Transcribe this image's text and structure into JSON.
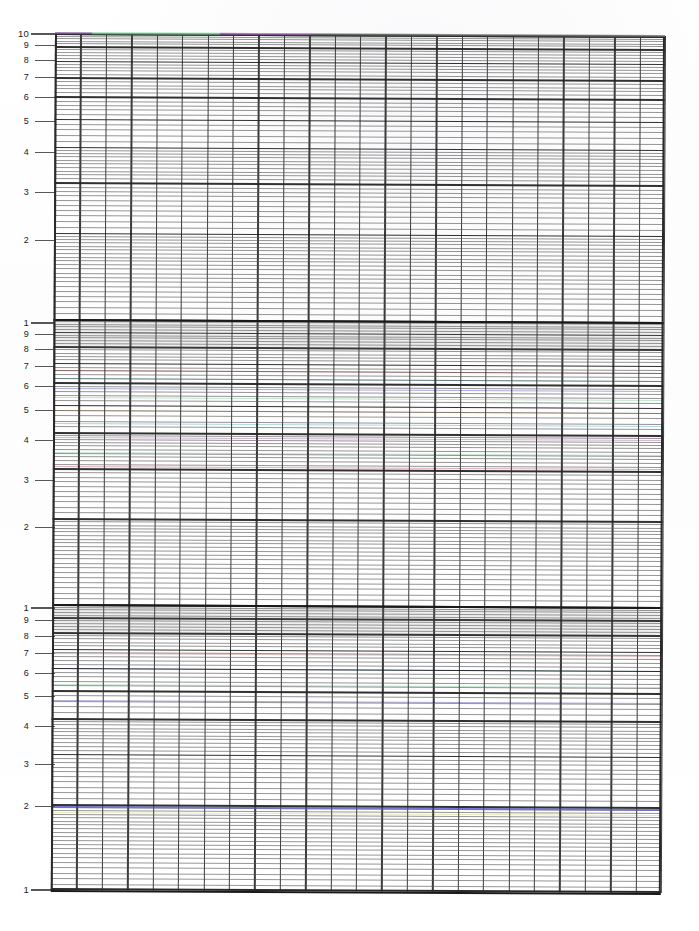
{
  "document": {
    "kind": "graph-paper-scan",
    "title": "3-cycle semi-logarithmic graph paper (scanned)",
    "background_color": "#fefefe",
    "paper_tint": "#fdfdfd"
  },
  "grid": {
    "left_px": 55,
    "top_px": 33,
    "width_px": 610,
    "height_px": 857,
    "skew_degrees": 0.28,
    "minor_line_color": "#555555",
    "major_line_color": "#262626",
    "decade_line_color": "#1a1a1a",
    "frame_color": "#2a2a2a",
    "x_columns": 24,
    "x_major_every": 1,
    "cycles": 3
  },
  "top_rule_segments": [
    {
      "name": "segment-purple-left",
      "start_pct": 0.0,
      "end_pct": 6.0,
      "color": "#8a5fa8"
    },
    {
      "name": "segment-green",
      "start_pct": 6.0,
      "end_pct": 27.0,
      "color": "#7ad79a"
    },
    {
      "name": "segment-magenta",
      "start_pct": 27.0,
      "end_pct": 42.0,
      "color": "#9b5fb0"
    },
    {
      "name": "segment-grey-right",
      "start_pct": 42.0,
      "end_pct": 100.0,
      "color": "#6e6e6e"
    }
  ],
  "chart_data": {
    "type": "line",
    "title": "",
    "subtitle": "",
    "xlabel": "",
    "ylabel": "",
    "grid": true,
    "legend_position": "none",
    "x_scale": "linear",
    "y_scale": "log",
    "xlim": [
      0,
      24
    ],
    "ylim": [
      1,
      1000
    ],
    "y_axis": {
      "scale": "log",
      "cycles": 3,
      "top_value": 10,
      "bottom_value": 1,
      "decade_labels": [
        "10",
        "1",
        "1",
        "1"
      ],
      "tick_labels_per_cycle": [
        "1",
        "2",
        "3",
        "4",
        "5",
        "6",
        "7",
        "8",
        "9"
      ]
    },
    "y_tick_labels": [
      {
        "text": "10",
        "y_px": 33,
        "cycle": 0,
        "mantissa": 10,
        "major": true
      },
      {
        "text": "9",
        "y_px": 45,
        "cycle": 0,
        "mantissa": 9,
        "major": false
      },
      {
        "text": "8",
        "y_px": 60,
        "cycle": 0,
        "mantissa": 8,
        "major": false
      },
      {
        "text": "7",
        "y_px": 77,
        "cycle": 0,
        "mantissa": 7,
        "major": false
      },
      {
        "text": "6",
        "y_px": 97,
        "cycle": 0,
        "mantissa": 6,
        "major": false
      },
      {
        "text": "5",
        "y_px": 121,
        "cycle": 0,
        "mantissa": 5,
        "major": false
      },
      {
        "text": "4",
        "y_px": 152,
        "cycle": 0,
        "mantissa": 4,
        "major": false
      },
      {
        "text": "3",
        "y_px": 192,
        "cycle": 0,
        "mantissa": 3,
        "major": false
      },
      {
        "text": "2",
        "y_px": 240,
        "cycle": 0,
        "mantissa": 2,
        "major": false
      },
      {
        "text": "1",
        "y_px": 322,
        "cycle": 1,
        "mantissa": 1,
        "major": true
      },
      {
        "text": "9",
        "y_px": 334,
        "cycle": 1,
        "mantissa": 9,
        "major": false
      },
      {
        "text": "8",
        "y_px": 349,
        "cycle": 1,
        "mantissa": 8,
        "major": false
      },
      {
        "text": "7",
        "y_px": 366,
        "cycle": 1,
        "mantissa": 7,
        "major": false
      },
      {
        "text": "6",
        "y_px": 386,
        "cycle": 1,
        "mantissa": 6,
        "major": false
      },
      {
        "text": "5",
        "y_px": 410,
        "cycle": 1,
        "mantissa": 5,
        "major": false
      },
      {
        "text": "4",
        "y_px": 440,
        "cycle": 1,
        "mantissa": 4,
        "major": false
      },
      {
        "text": "3",
        "y_px": 480,
        "cycle": 1,
        "mantissa": 3,
        "major": false
      },
      {
        "text": "2",
        "y_px": 527,
        "cycle": 1,
        "mantissa": 2,
        "major": false
      },
      {
        "text": "1",
        "y_px": 607,
        "cycle": 2,
        "mantissa": 1,
        "major": true
      },
      {
        "text": "9",
        "y_px": 620,
        "cycle": 2,
        "mantissa": 9,
        "major": false
      },
      {
        "text": "8",
        "y_px": 636,
        "cycle": 2,
        "mantissa": 8,
        "major": false
      },
      {
        "text": "7",
        "y_px": 653,
        "cycle": 2,
        "mantissa": 7,
        "major": false
      },
      {
        "text": "6",
        "y_px": 673,
        "cycle": 2,
        "mantissa": 6,
        "major": false
      },
      {
        "text": "5",
        "y_px": 696,
        "cycle": 2,
        "mantissa": 5,
        "major": false
      },
      {
        "text": "4",
        "y_px": 726,
        "cycle": 2,
        "mantissa": 4,
        "major": false
      },
      {
        "text": "3",
        "y_px": 764,
        "cycle": 2,
        "mantissa": 3,
        "major": false
      },
      {
        "text": "2",
        "y_px": 806,
        "cycle": 2,
        "mantissa": 2,
        "major": false
      },
      {
        "text": "1",
        "y_px": 889,
        "cycle": 3,
        "mantissa": 1,
        "major": true
      }
    ],
    "series": [
      {
        "name": "top-rule-trace",
        "color": "#7ad79a",
        "y_px": 33,
        "values": [
          10,
          10,
          10,
          10,
          10,
          10,
          10,
          10,
          10,
          10,
          10,
          10,
          10,
          10,
          10,
          10,
          10,
          10,
          10,
          10,
          10,
          10,
          10,
          10
        ]
      },
      {
        "name": "blue-trace-lower-2",
        "color": "#5a5ad0",
        "y_px": 806,
        "values": [
          2,
          2,
          2,
          2,
          2,
          2,
          2,
          2,
          2,
          2,
          2,
          2,
          2,
          2,
          2,
          2,
          2,
          2,
          2,
          2,
          2,
          2,
          2,
          2
        ]
      }
    ],
    "annotations": [
      {
        "name": "scan-fringe",
        "note": "faint chromatic fringes on horizontal rules from scanning"
      }
    ]
  },
  "fringe_lines": [
    {
      "y_px": 33,
      "color": "#9b5fb0"
    },
    {
      "y_px": 370,
      "color": "#c96d6d"
    },
    {
      "y_px": 378,
      "color": "#6fb7c9"
    },
    {
      "y_px": 388,
      "color": "#6a6ac2"
    },
    {
      "y_px": 397,
      "color": "#8fd0a8"
    },
    {
      "y_px": 410,
      "color": "#c9a86d"
    },
    {
      "y_px": 423,
      "color": "#6fb7c9"
    },
    {
      "y_px": 437,
      "color": "#b07ab5"
    },
    {
      "y_px": 452,
      "color": "#8fd0a8"
    },
    {
      "y_px": 466,
      "color": "#c96d8d"
    },
    {
      "y_px": 653,
      "color": "#c98f8f"
    },
    {
      "y_px": 668,
      "color": "#7aa8d0"
    },
    {
      "y_px": 684,
      "color": "#8fd0a8"
    },
    {
      "y_px": 700,
      "color": "#6a6ac2"
    },
    {
      "y_px": 806,
      "color": "#5a5ad0"
    },
    {
      "y_px": 812,
      "color": "#d8d88a"
    }
  ],
  "shaded_bands": [
    {
      "name": "band-cycle-1-top",
      "top_px": 322,
      "height_px": 26,
      "color": "rgba(120,120,125,0.12)"
    },
    {
      "name": "band-cycle-2-top",
      "top_px": 607,
      "height_px": 26,
      "color": "rgba(120,120,125,0.12)"
    }
  ]
}
